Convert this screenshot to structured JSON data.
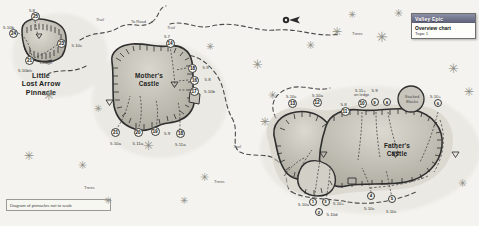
{
  "meta": {
    "disclaimer": "Diagram of pinnacles not to scale"
  },
  "legend": {
    "titlebar": "Valley Epic",
    "line1": "Overview chart",
    "line2": "Topo 1"
  },
  "formations": [
    {
      "id": "little-lost-arrow",
      "name_lines": [
        "Little",
        "Lost Arrow",
        "Pinnacle"
      ]
    },
    {
      "id": "mothers-castle",
      "name_lines": [
        "Mother's",
        "Castle"
      ]
    },
    {
      "id": "fathers-castle",
      "name_lines": [
        "Father's",
        "Castle"
      ]
    }
  ],
  "map_labels": {
    "to_road": "To Road",
    "trail_upper": "Trail",
    "trail_mid": "Trail",
    "trail_lower": "Trail",
    "trees_upper": "Trees",
    "trees_lower": "Trees",
    "stacked_blocks": [
      "Stacked",
      "Blocks"
    ],
    "on_ledge": "on ledge",
    "ledge": "Ledge",
    "compass": "north-arrow"
  },
  "routes": [
    {
      "num": "25",
      "grade": "5.8",
      "x": 35.5,
      "y": 16.5,
      "gx": 32.0,
      "gy": 8.5,
      "ga": "center"
    },
    {
      "num": "24",
      "grade": "5.10b",
      "x": 13.5,
      "y": 33.0,
      "gx": 3.0,
      "gy": 26.0,
      "ga": "left"
    },
    {
      "num": "23",
      "grade": "5.10c",
      "x": 61.5,
      "y": 43.0,
      "gx": 71.5,
      "gy": 43.5,
      "ga": "left"
    },
    {
      "num": "21",
      "grade": "Ledge",
      "x": 29.5,
      "y": 60.0,
      "gx": 40.0,
      "gy": 60.5,
      "ga": "left"
    },
    {
      "num": "",
      "grade": "5.10b/c",
      "x": null,
      "y": null,
      "gx": 18.0,
      "gy": 69.0,
      "ga": "left"
    },
    {
      "num": "14",
      "grade": "5.7",
      "x": 170.0,
      "y": 43.5,
      "gx": 167.0,
      "gy": 35.0,
      "ga": "center"
    },
    {
      "num": "18",
      "grade": "5.9",
      "x": 192.5,
      "y": 68.5,
      "gx": 202.5,
      "gy": 66.0,
      "ga": "left"
    },
    {
      "num": "16",
      "grade": "5.8",
      "x": 194.5,
      "y": 80.5,
      "gx": 204.5,
      "gy": 78.0,
      "ga": "left"
    },
    {
      "num": "17",
      "grade": "5.10b",
      "x": 194.0,
      "y": 91.0,
      "gx": 204.0,
      "gy": 90.0,
      "ga": "left"
    },
    {
      "num": "21",
      "grade": "5.10a",
      "x": 115.5,
      "y": 132.0,
      "gx": 110.0,
      "gy": 142.0,
      "ga": "left"
    },
    {
      "num": "20",
      "grade": "5.11a",
      "x": 138.0,
      "y": 132.0,
      "gx": 132.5,
      "gy": 142.0,
      "ga": "left"
    },
    {
      "num": "19",
      "grade": "5.9",
      "x": 155.0,
      "y": 131.0,
      "gx": 164.0,
      "gy": 132.0,
      "ga": "left"
    },
    {
      "num": "18",
      "grade": "5.11a",
      "x": 180.5,
      "y": 133.0,
      "gx": 175.0,
      "gy": 143.0,
      "ga": "left"
    },
    {
      "num": "13",
      "grade": "5.10c",
      "x": 292.5,
      "y": 103.0,
      "gx": 286.0,
      "gy": 94.5,
      "ga": "left"
    },
    {
      "num": "12",
      "grade": "5.10a",
      "x": 317.0,
      "y": 102.0,
      "gx": 312.0,
      "gy": 93.5,
      "ga": "left"
    },
    {
      "num": "11",
      "grade": "5.8",
      "x": 345.0,
      "y": 111.5,
      "gx": 340.5,
      "gy": 103.0,
      "ga": "left"
    },
    {
      "num": "10",
      "grade": "5.11+",
      "x": 362.0,
      "y": 103.5,
      "gx": 355.0,
      "gy": 88.5,
      "ga": "left"
    },
    {
      "num": "9",
      "grade": "5.9",
      "x": 375.0,
      "y": 102.5,
      "gx": 371.5,
      "gy": 88.5,
      "ga": "left"
    },
    {
      "num": "8",
      "grade": "",
      "x": 387.5,
      "y": 102.5,
      "gx": null,
      "gy": null,
      "ga": "left"
    },
    {
      "num": "6",
      "grade": "5.10+",
      "x": 438.5,
      "y": 103.5,
      "gx": 430.0,
      "gy": 95.0,
      "ga": "left"
    },
    {
      "num": "1",
      "grade": "5.10a",
      "x": 313.5,
      "y": 202.0,
      "gx": 298.0,
      "gy": 203.0,
      "ga": "left"
    },
    {
      "num": "3",
      "grade": "5.10+",
      "x": 326.0,
      "y": 202.0,
      "gx": 333.0,
      "gy": 202.0,
      "ga": "left"
    },
    {
      "num": "2",
      "grade": "5.10d",
      "x": 319.5,
      "y": 212.5,
      "gx": 326.5,
      "gy": 212.5,
      "ga": "left"
    },
    {
      "num": "4",
      "grade": "5.10c",
      "x": 371.5,
      "y": 196.0,
      "gx": 364.0,
      "gy": 207.0,
      "ga": "left"
    },
    {
      "num": "5",
      "grade": "5.10c",
      "x": 392.5,
      "y": 199.0,
      "gx": 386.0,
      "gy": 209.5,
      "ga": "left"
    }
  ],
  "colors": {
    "rock_fill": "#b9b6ad",
    "rock_fill_light": "#d7d4cb",
    "rock_edge": "#2f2f2f",
    "trail": "#4b4b4b",
    "paper": "#f4f3ef",
    "tree": "#8e8e86",
    "legend_bar_top": "#8d8fa6",
    "legend_bar_bottom": "#5d5f78"
  }
}
